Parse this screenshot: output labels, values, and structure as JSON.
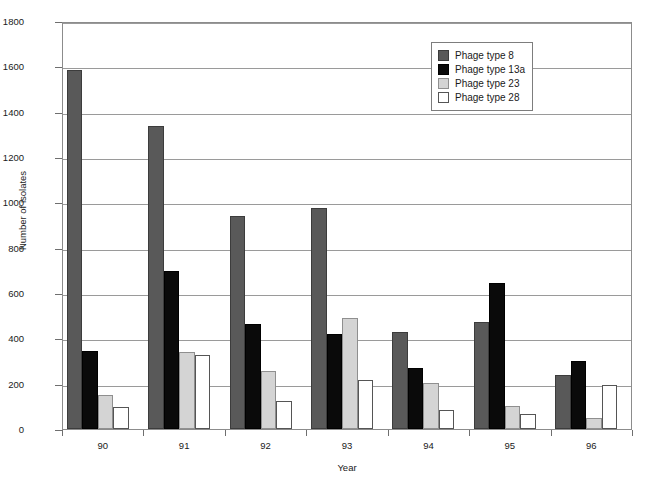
{
  "chart_data": {
    "type": "bar",
    "title": "",
    "xlabel": "Year",
    "ylabel": "Number of isolates",
    "categories": [
      "90",
      "91",
      "92",
      "93",
      "94",
      "95",
      "96"
    ],
    "ylim": [
      0,
      1800
    ],
    "ytick_step": 200,
    "yticks": [
      0,
      200,
      400,
      600,
      800,
      1000,
      1200,
      1400,
      1600,
      1800
    ],
    "grid": "horizontal",
    "legend_position": "top-right",
    "series": [
      {
        "name": "Phage type 8",
        "color": "#595959",
        "values": [
          1585,
          1335,
          940,
          975,
          430,
          470,
          240
        ]
      },
      {
        "name": "Phage type 13a",
        "color": "#0a0a0a",
        "values": [
          345,
          695,
          465,
          420,
          270,
          645,
          300
        ]
      },
      {
        "name": "Phage type 23",
        "color": "#d4d4d4",
        "values": [
          150,
          340,
          255,
          490,
          205,
          100,
          50
        ]
      },
      {
        "name": "Phage type 28",
        "color": "#ffffff",
        "values": [
          95,
          325,
          125,
          215,
          85,
          65,
          195
        ]
      }
    ]
  },
  "caption": {
    "text": ""
  }
}
